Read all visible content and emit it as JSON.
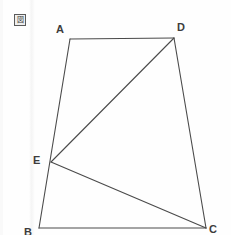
{
  "figure": {
    "tag_glyph": "図",
    "tag_name": "figure-marker",
    "background_color": "#fefefe",
    "line_color": "#4a4a4a",
    "label_color": "#3c3c3c",
    "width": 231,
    "height": 235
  },
  "geometry": {
    "type": "plane-geometry-quadrilateral-with-cevians",
    "points": {
      "A": {
        "label": "A",
        "x": 70,
        "y": 39
      },
      "B": {
        "label": "B",
        "x": 39,
        "y": 228
      },
      "C": {
        "label": "C",
        "x": 206,
        "y": 228
      },
      "D": {
        "label": "D",
        "x": 174,
        "y": 38
      },
      "E": {
        "label": "E",
        "x": 51,
        "y": 162
      }
    },
    "edges": [
      {
        "name": "AD",
        "from": "A",
        "to": "D"
      },
      {
        "name": "DC",
        "from": "D",
        "to": "C"
      },
      {
        "name": "CB",
        "from": "C",
        "to": "B"
      },
      {
        "name": "BA",
        "from": "B",
        "to": "A"
      }
    ],
    "diagonals": [
      {
        "name": "ED",
        "from": "E",
        "to": "D"
      },
      {
        "name": "EC",
        "from": "E",
        "to": "C"
      }
    ],
    "notes": "E lies on segment AB"
  },
  "labels": {
    "A": "A",
    "B": "B",
    "C": "C",
    "D": "D",
    "E": "E"
  }
}
